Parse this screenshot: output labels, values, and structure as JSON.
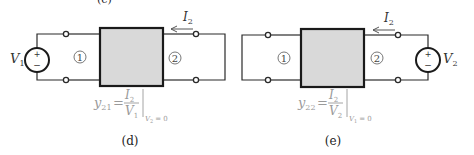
{
  "figure": {
    "type": "two-port network y-parameter measurement circuits",
    "top_partial_label": "(c)",
    "panels": [
      {
        "id": "d",
        "caption": "(d)",
        "source": {
          "label_main": "V",
          "label_sub": "1",
          "plus": "+",
          "minus": "−",
          "side": "left"
        },
        "port_left": "1",
        "port_right": "2",
        "current": {
          "label_main": "I",
          "label_sub": "2",
          "direction": "left"
        },
        "right_side": "short circuit",
        "equation": {
          "lhs_main": "y",
          "lhs_sub": "21",
          "equals": "=",
          "num_main": "I",
          "num_sub": "2",
          "den_main": "V",
          "den_sub": "1",
          "cond_main": "V",
          "cond_sub": "2",
          "cond_rest": "= 0"
        }
      },
      {
        "id": "e",
        "caption": "(e)",
        "source": {
          "label_main": "V",
          "label_sub": "2",
          "plus": "+",
          "minus": "−",
          "side": "right"
        },
        "port_left": "1",
        "port_right": "2",
        "current": {
          "label_main": "I",
          "label_sub": "2",
          "direction": "left"
        },
        "left_side": "short circuit",
        "equation": {
          "lhs_main": "y",
          "lhs_sub": "22",
          "equals": "=",
          "num_main": "I",
          "num_sub": "2",
          "den_main": "V",
          "den_sub": "2",
          "cond_main": "V",
          "cond_sub": "1",
          "cond_rest": "= 0"
        }
      }
    ]
  }
}
